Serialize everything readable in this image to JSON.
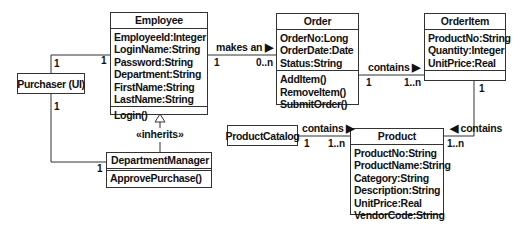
{
  "classes": {
    "employee": {
      "name": "Employee",
      "attributes": [
        "EmployeeId:Integer",
        "LoginName:String",
        "Password:String",
        "Department:String",
        "FirstName:String",
        "LastName:String"
      ],
      "operations": [
        "Login()"
      ]
    },
    "order": {
      "name": "Order",
      "attributes": [
        "OrderNo:Long",
        "OrderDate:Date",
        "Status:String"
      ],
      "operations": [
        "AddItem()",
        "RemoveItem()",
        "SubmitOrder()"
      ]
    },
    "order_item": {
      "name": "OrderItem",
      "attributes": [
        "ProductNo:String",
        "Quantity:Integer",
        "UnitPrice:Real"
      ],
      "operations": []
    },
    "purchaser": {
      "name": "Purchaser (UI)"
    },
    "department_manager": {
      "name": "DepartmentManager",
      "operations": [
        "ApprovePurchase()"
      ]
    },
    "product_catalog": {
      "name": "ProductCatalog"
    },
    "product": {
      "name": "Product",
      "attributes": [
        "ProductNo:String",
        "ProductName:String",
        "Category:String",
        "Description:String",
        "UnitPrice:Real",
        "VendorCode:String"
      ]
    }
  },
  "associations": {
    "employee_order": {
      "label": "makes an ▶",
      "mult_from": "1",
      "mult_to": "0..n"
    },
    "order_orderitem": {
      "label": "contains ▶",
      "mult_from": "1",
      "mult_to": "1..n"
    },
    "orderitem_product": {
      "label": "◀ contains",
      "mult_from": "1",
      "mult_to": "1..n"
    },
    "catalog_product": {
      "label": "contains ▶",
      "mult_from": "1",
      "mult_to": "1..n"
    },
    "purchaser_employee": {
      "mult_purchaser": "1",
      "mult_employee": "1"
    },
    "purchaser_manager": {
      "mult_purchaser": "1",
      "mult_manager": "1"
    },
    "inheritance": {
      "label": "«inherits»"
    }
  }
}
